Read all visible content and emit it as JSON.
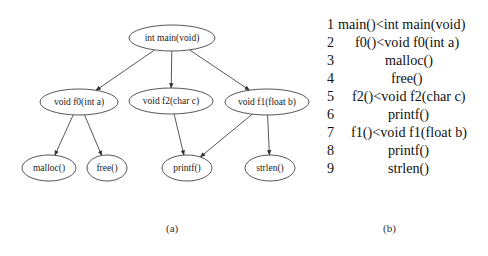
{
  "call_graph": {
    "nodes": [
      {
        "id": "main",
        "label": "int main(void)",
        "cx": 172,
        "cy": 38,
        "rx": 43,
        "ry": 13
      },
      {
        "id": "f0",
        "label": "void f0(int a)",
        "cx": 79,
        "cy": 102,
        "rx": 39,
        "ry": 13
      },
      {
        "id": "f2",
        "label": "void f2(char c)",
        "cx": 171,
        "cy": 101,
        "rx": 42,
        "ry": 13
      },
      {
        "id": "f1",
        "label": "void f1(float b)",
        "cx": 267,
        "cy": 102,
        "rx": 42,
        "ry": 13
      },
      {
        "id": "malloc",
        "label": "malloc()",
        "cx": 49,
        "cy": 168,
        "rx": 27,
        "ry": 13
      },
      {
        "id": "free",
        "label": "free()",
        "cx": 107,
        "cy": 168,
        "rx": 20,
        "ry": 13
      },
      {
        "id": "printf",
        "label": "printf()",
        "cx": 187,
        "cy": 168,
        "rx": 25,
        "ry": 13
      },
      {
        "id": "strlen",
        "label": "strlen()",
        "cx": 270,
        "cy": 168,
        "rx": 25,
        "ry": 13
      }
    ],
    "edges": [
      {
        "from": "main",
        "to": "f0"
      },
      {
        "from": "main",
        "to": "f2"
      },
      {
        "from": "main",
        "to": "f1"
      },
      {
        "from": "f0",
        "to": "malloc"
      },
      {
        "from": "f0",
        "to": "free"
      },
      {
        "from": "f2",
        "to": "printf"
      },
      {
        "from": "f1",
        "to": "printf"
      },
      {
        "from": "f1",
        "to": "strlen"
      }
    ]
  },
  "listing": {
    "lines": [
      {
        "num": "1",
        "text": "main()<int main(void)",
        "indent": 11
      },
      {
        "num": "2",
        "text": "f0()<void f0(int a)",
        "indent": 28
      },
      {
        "num": "3",
        "text": "malloc()",
        "indent": 58
      },
      {
        "num": "4",
        "text": "free()",
        "indent": 64
      },
      {
        "num": "5",
        "text": "f2()<void f2(char c)",
        "indent": 25
      },
      {
        "num": "6",
        "text": "printf()",
        "indent": 61
      },
      {
        "num": "7",
        "text": "f1()<void f1(float b)",
        "indent": 24
      },
      {
        "num": "8",
        "text": "printf()",
        "indent": 61
      },
      {
        "num": "9",
        "text": "strlen()",
        "indent": 61
      }
    ]
  },
  "captions": {
    "a": "(a)",
    "b": "(b)"
  }
}
